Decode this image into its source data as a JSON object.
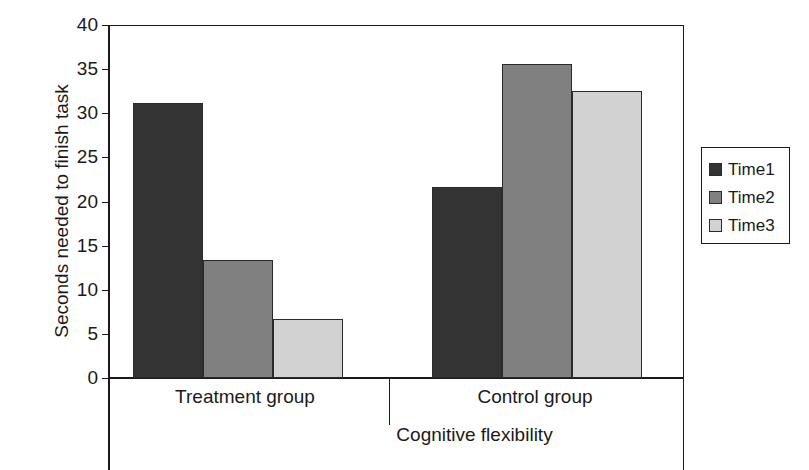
{
  "chart_data": {
    "type": "bar",
    "title": "",
    "xlabel": "Cognitive flexibility",
    "ylabel": "Seconds needed to finish task",
    "categories": [
      "Treatment group",
      "Control group"
    ],
    "series": [
      {
        "name": "Time1",
        "values": [
          31.2,
          21.6
        ],
        "color": "#333333"
      },
      {
        "name": "Time2",
        "values": [
          13.4,
          35.6
        ],
        "color": "#808080"
      },
      {
        "name": "Time3",
        "values": [
          6.7,
          32.5
        ],
        "color": "#d2d2d2"
      }
    ],
    "ylim": [
      0,
      40
    ],
    "yticks": [
      "0",
      "5",
      "10",
      "15",
      "20",
      "25",
      "30",
      "35",
      "40"
    ],
    "grid": false,
    "legend_position": "right"
  },
  "axes": {
    "y_title": "Seconds needed to finish task",
    "x_title": "Cognitive flexibility"
  },
  "legend": {
    "entries": [
      {
        "label": "Time1",
        "color": "#333333"
      },
      {
        "label": "Time2",
        "color": "#808080"
      },
      {
        "label": "Time3",
        "color": "#d2d2d2"
      }
    ]
  },
  "groups": [
    {
      "label": "Treatment group"
    },
    {
      "label": "Control group"
    }
  ]
}
